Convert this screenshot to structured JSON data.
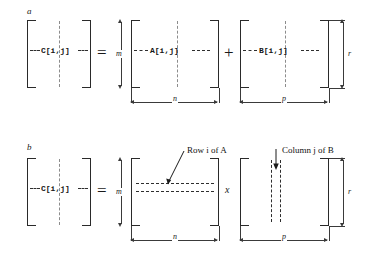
{
  "figure": {
    "title_visible": false,
    "panels": [
      {
        "letter": "a",
        "operation": "addition",
        "result_matrix": {
          "label": "C[i,j]"
        },
        "equals_sign": "=",
        "operator_sign": "+",
        "operand_matrices": [
          {
            "label": "A[i,j]"
          },
          {
            "label": "B[i,j]"
          }
        ],
        "dimensions": {
          "rows_left": "m",
          "cols_first": "n",
          "cols_second": "p",
          "rows_right": "r"
        }
      },
      {
        "letter": "b",
        "operation": "multiplication",
        "result_matrix": {
          "label": "C[i,j]"
        },
        "equals_sign": "=",
        "operator_sign": "x",
        "operand_matrices": [
          {
            "label": "",
            "annotation": "Row i of A"
          },
          {
            "label": "",
            "annotation": "Column j of B"
          }
        ],
        "dimensions": {
          "rows_left": "m",
          "cols_first": "n",
          "cols_second": "p",
          "rows_right": "r"
        }
      }
    ]
  },
  "colors": {
    "ink": "#1a1a1a",
    "rule": "#3a3a3a",
    "guide_dash": "#8c8c8c",
    "highlight_dash": "#2e2e2e",
    "background": "#ffffff"
  }
}
